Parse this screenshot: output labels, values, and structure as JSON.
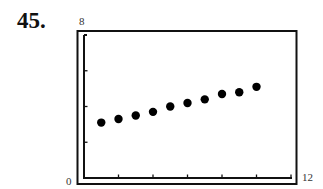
{
  "problem": {
    "number": "45."
  },
  "chart_data": {
    "type": "scatter",
    "title": "",
    "xlabel": "",
    "ylabel": "",
    "xlim": [
      0,
      12
    ],
    "ylim": [
      0,
      8
    ],
    "x_tick_step": 2,
    "y_tick_step": 2,
    "x_tick_labels": {
      "min": "0",
      "max": "12"
    },
    "y_tick_labels": {
      "max": "8"
    },
    "grid": false,
    "legend": null,
    "series": [
      {
        "name": "data",
        "color": "#000000",
        "x": [
          1,
          2,
          3,
          4,
          5,
          6,
          7,
          8,
          9,
          10
        ],
        "y": [
          3.1,
          3.3,
          3.5,
          3.7,
          4.0,
          4.2,
          4.4,
          4.7,
          4.8,
          5.1
        ]
      }
    ]
  }
}
